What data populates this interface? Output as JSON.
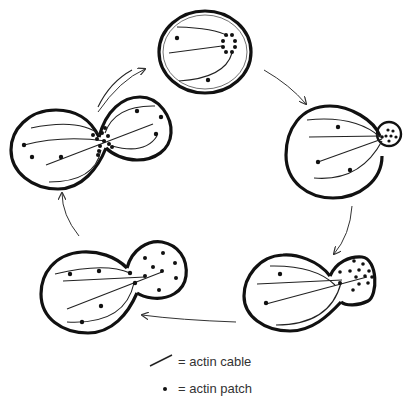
{
  "figure": {
    "stages": [
      {
        "id": "unbudded",
        "label": "unbudded cell with patches clustered at presumptive bud site"
      },
      {
        "id": "small-bud",
        "label": "small bud with patches concentrated in bud"
      },
      {
        "id": "medium-bud",
        "label": "medium bud with patches in bud"
      },
      {
        "id": "large-bud",
        "label": "large bud, patches throughout"
      },
      {
        "id": "cytokinesis",
        "label": "patches at mother-bud neck"
      }
    ],
    "cycle_direction": "clockwise"
  },
  "legend": {
    "items": [
      {
        "symbol": "line",
        "text": "= actin cable"
      },
      {
        "symbol": "dot",
        "text": "= actin patch"
      }
    ]
  },
  "colors": {
    "stroke": "#111111",
    "background": "#ffffff"
  }
}
